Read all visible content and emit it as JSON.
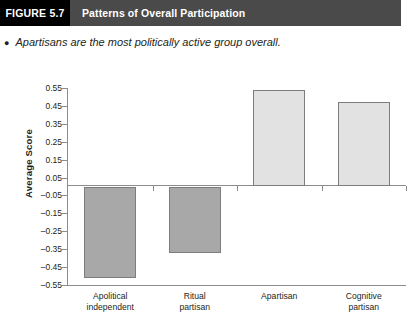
{
  "header": {
    "figure_tag": "FIGURE 5.7",
    "title": "Patterns of Overall Participation"
  },
  "bullet": {
    "marker": "bullet-dot",
    "text": "Apartisans are the most politically active group overall."
  },
  "colors": {
    "header_tag_bg": "#000000",
    "header_title_bg": "#4a4a4a",
    "negative_bar": "#a8a8a8",
    "positive_bar": "#e2e2e2",
    "bar_border": "#7d7d7d",
    "axis": "#8c8c8c",
    "text": "#231f20"
  },
  "chart_data": {
    "type": "bar",
    "title": "Patterns of Overall Participation",
    "xlabel": "",
    "ylabel": "Average Score",
    "categories": [
      "Apolitical independent",
      "Ritual partisan",
      "Apartisan",
      "Cognitive partisan"
    ],
    "category_lines": [
      [
        "Apolitical",
        "independent"
      ],
      [
        "Ritual",
        "partisan"
      ],
      [
        "Apartisan",
        ""
      ],
      [
        "Cognitive",
        "partisan"
      ]
    ],
    "values": [
      -0.51,
      -0.37,
      0.54,
      0.47
    ],
    "ylim": [
      -0.55,
      0.55
    ],
    "ytick_labels": [
      "0.55",
      "0.45",
      "0.35",
      "0.25",
      "0.15",
      "0.05",
      "–0.05",
      "–0.15",
      "–0.25",
      "–0.35",
      "–0.45",
      "–0.55"
    ],
    "ytick_values": [
      0.55,
      0.45,
      0.35,
      0.25,
      0.15,
      0.05,
      -0.05,
      -0.15,
      -0.25,
      -0.35,
      -0.45,
      -0.55
    ],
    "grid": false,
    "legend": "none"
  }
}
